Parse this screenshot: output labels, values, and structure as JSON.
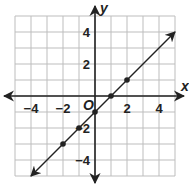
{
  "chart_data": {
    "type": "line",
    "title": "",
    "xlabel": "x",
    "ylabel": "y",
    "origin_label": "O",
    "xlim": [
      -5,
      5
    ],
    "ylim": [
      -5,
      5
    ],
    "grid": true,
    "x_ticks": [
      -4,
      -2,
      2,
      4
    ],
    "y_ticks": [
      4,
      2,
      -2,
      -4
    ],
    "x_tick_labels": [
      "−4",
      "−2",
      "2",
      "4"
    ],
    "y_tick_labels": [
      "4",
      "2",
      "−2",
      "−4"
    ],
    "series": [
      {
        "name": "line",
        "equation": "y = x - 1",
        "x": [
          -2,
          -1,
          0,
          1,
          2
        ],
        "y": [
          -3,
          -2,
          -1,
          0,
          1
        ],
        "line_extent": [
          [
            -4,
            -5
          ],
          [
            5,
            4
          ]
        ],
        "arrows": "both"
      }
    ],
    "colors": {
      "grid": "#bdbdbd",
      "axis": "#222222",
      "line": "#222222"
    }
  }
}
